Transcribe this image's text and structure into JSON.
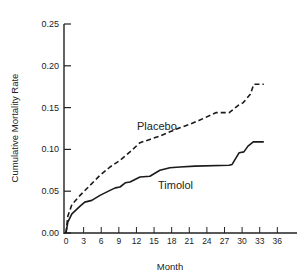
{
  "chart_data": {
    "type": "line",
    "title": "",
    "xlabel": "Month",
    "ylabel": "Cumulative Mortality Rate",
    "xlim": [
      0,
      36
    ],
    "ylim": [
      0,
      0.25
    ],
    "x_ticks": [
      0,
      3,
      6,
      9,
      12,
      15,
      18,
      21,
      24,
      27,
      30,
      33,
      36
    ],
    "x_tick_labels": [
      "0",
      "3",
      "6",
      "9",
      "12",
      "15",
      "18",
      "21",
      "24",
      "27",
      "30",
      "33",
      "36"
    ],
    "y_ticks": [
      0,
      0.05,
      0.1,
      0.15,
      0.2,
      0.25
    ],
    "y_tick_labels": [
      "0.00",
      "0.05",
      "0.10",
      "0.15",
      "0.20",
      "0.25"
    ],
    "grid": false,
    "legend": "inline labels",
    "series": [
      {
        "name": "Placebo",
        "style": "dashed",
        "x": [
          0,
          0.3,
          1,
          2.4,
          4.1,
          5.8,
          7.5,
          9.2,
          10.9,
          12.6,
          14.3,
          16.0,
          17.7,
          19.4,
          21.1,
          22.8,
          25.6,
          27.8,
          29.4,
          30.2,
          31.4,
          32.0,
          33.7
        ],
        "y": [
          0.0,
          0.02,
          0.034,
          0.045,
          0.057,
          0.069,
          0.079,
          0.087,
          0.097,
          0.108,
          0.112,
          0.116,
          0.121,
          0.126,
          0.13,
          0.135,
          0.144,
          0.144,
          0.153,
          0.156,
          0.166,
          0.178,
          0.178
        ]
      },
      {
        "name": "Timolol",
        "style": "solid",
        "x": [
          0,
          0.3,
          1,
          2.4,
          3.2,
          4.4,
          5.8,
          7.5,
          8.4,
          9.2,
          10.1,
          10.9,
          12.6,
          14.3,
          16.0,
          17.7,
          19.4,
          22.0,
          27.8,
          28.3,
          29.5,
          30.3,
          31.0,
          31.9,
          33.7
        ],
        "y": [
          0.0,
          0.013,
          0.023,
          0.032,
          0.037,
          0.039,
          0.045,
          0.051,
          0.054,
          0.055,
          0.06,
          0.061,
          0.067,
          0.068,
          0.075,
          0.078,
          0.079,
          0.08,
          0.081,
          0.082,
          0.096,
          0.097,
          0.104,
          0.109,
          0.109
        ]
      }
    ],
    "annotations": [
      {
        "text": "Placebo",
        "x": 12.2,
        "y": 0.124
      },
      {
        "text": "Timolol",
        "x": 15.3,
        "y": 0.066
      }
    ]
  },
  "labels": {
    "xlabel": "Month",
    "ylabel": "Cumulative Mortality Rate",
    "placebo": "Placebo",
    "timolol": "Timolol"
  }
}
